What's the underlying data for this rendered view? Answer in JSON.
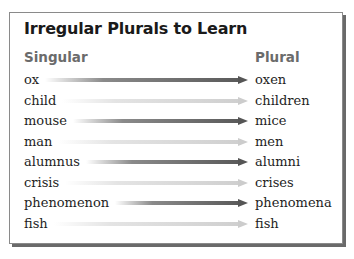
{
  "title": "Irregular Plurals to Learn",
  "columns": {
    "singular": "Singular",
    "plural": "Plural"
  },
  "rows": [
    {
      "singular": "ox",
      "plural": "oxen",
      "arrow": "dark"
    },
    {
      "singular": "child",
      "plural": "children",
      "arrow": "light"
    },
    {
      "singular": "mouse",
      "plural": "mice",
      "arrow": "dark"
    },
    {
      "singular": "man",
      "plural": "men",
      "arrow": "light"
    },
    {
      "singular": "alumnus",
      "plural": "alumni",
      "arrow": "dark"
    },
    {
      "singular": "crisis",
      "plural": "crises",
      "arrow": "light"
    },
    {
      "singular": "phenomenon",
      "plural": "phenomena",
      "arrow": "dark"
    },
    {
      "singular": "fish",
      "plural": "fish",
      "arrow": "light"
    }
  ],
  "colors": {
    "arrow_dark": "#555555",
    "arrow_light": "#cccccc",
    "header_gray": "#6b6b6b",
    "border": "#8a8a8a",
    "shadow": "#6a6a6a"
  }
}
